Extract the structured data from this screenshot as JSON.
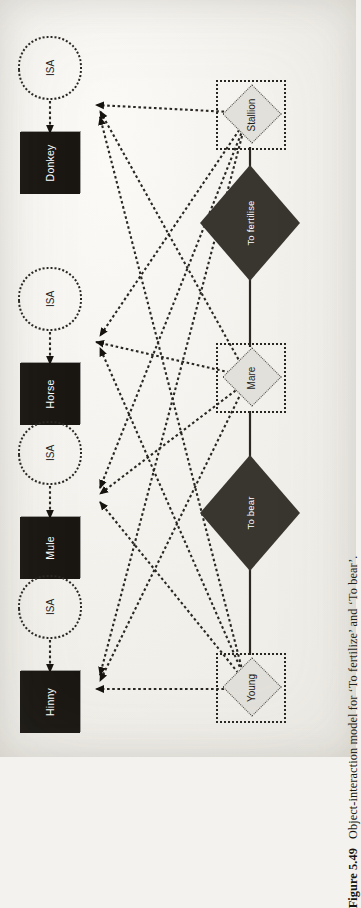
{
  "figure": {
    "number": "Figure 5.49",
    "caption": "Object-interaction model for ‘To fertilize’ and ‘To bear’."
  },
  "diagram": {
    "type": "object-interaction-model",
    "entities": [
      {
        "id": "hinny",
        "label": "Hinny"
      },
      {
        "id": "mule",
        "label": "Mule"
      },
      {
        "id": "horse",
        "label": "Horse"
      },
      {
        "id": "donkey",
        "label": "Donkey"
      }
    ],
    "isa_nodes": [
      {
        "id": "isa-hinny",
        "label": "ISA"
      },
      {
        "id": "isa-mule",
        "label": "ISA"
      },
      {
        "id": "isa-horse",
        "label": "ISA"
      },
      {
        "id": "isa-donkey",
        "label": "ISA"
      }
    ],
    "objects": [
      {
        "id": "young",
        "label": "Young"
      },
      {
        "id": "mare",
        "label": "Mare"
      },
      {
        "id": "stallion",
        "label": "Stallion"
      }
    ],
    "operations": [
      {
        "id": "to-bear",
        "label": "To bear"
      },
      {
        "id": "to-fertilise",
        "label": "To fertilise"
      }
    ],
    "colors": {
      "entity_fill": "#1a1713",
      "entity_text": "#ffffff",
      "object_fill": "#e2e0da",
      "operation_fill": "#39352f",
      "operation_text": "#ffffff",
      "line": "#2a2722",
      "page": "#f4f2ee"
    }
  }
}
